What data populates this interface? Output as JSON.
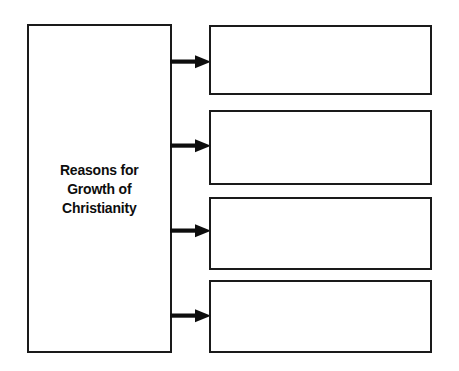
{
  "diagram": {
    "type": "graphic-organizer",
    "title": "Reasons for Growth of Christianity",
    "main_box": {
      "label": "Reasons for\nGrowth of\nChristianity"
    },
    "arrows": [
      {
        "name": "arrow-to-box-1",
        "glyph": "right-arrow"
      },
      {
        "name": "arrow-to-box-2",
        "glyph": "right-arrow"
      },
      {
        "name": "arrow-to-box-3",
        "glyph": "right-arrow"
      },
      {
        "name": "arrow-to-box-4",
        "glyph": "right-arrow"
      }
    ],
    "answer_boxes": [
      {
        "index": 1,
        "text": ""
      },
      {
        "index": 2,
        "text": ""
      },
      {
        "index": 3,
        "text": ""
      },
      {
        "index": 4,
        "text": ""
      }
    ],
    "colors": {
      "border": "#1a1a1a",
      "text": "#0d0d0d",
      "background": "#ffffff",
      "arrow": "#0d0d0d"
    }
  }
}
